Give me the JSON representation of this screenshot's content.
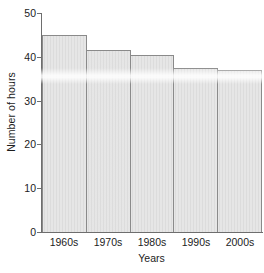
{
  "chart_data": {
    "type": "bar",
    "title": "",
    "categories": [
      "1960s",
      "1970s",
      "1980s",
      "1990s",
      "2000s"
    ],
    "values": [
      45,
      41.5,
      40.5,
      37.5,
      37
    ],
    "xlabel": "Years",
    "ylabel": "Number of hours",
    "ylim": [
      0,
      50
    ],
    "yticks": [
      0,
      10,
      20,
      30,
      40,
      50
    ],
    "ytick_labels": [
      "0",
      "10",
      "20",
      "30",
      "40",
      "50"
    ],
    "grid": false,
    "legend": null,
    "bar_fill_color": "#dcdcdc",
    "bar_edge_color": "#8a8a8a",
    "axis_color": "#6e6e6e",
    "text_color": "#1c1c1c",
    "background_color": "#ffffff",
    "bar_gap": 0
  }
}
